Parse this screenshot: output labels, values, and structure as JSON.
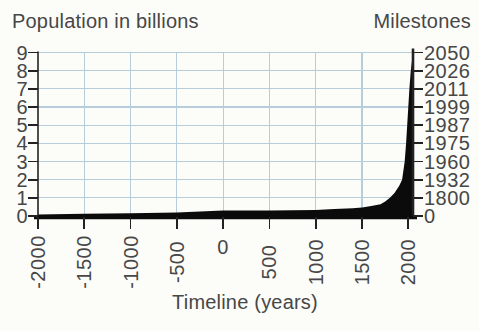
{
  "figure": {
    "left_axis_title": "Population in billions",
    "right_axis_title": "Milestones",
    "x_axis_title": "Timeline (years)"
  },
  "colors": {
    "background": "#fcfcf9",
    "grid": "#b7cddc",
    "area": "#0b0b0b",
    "axis": "#222222",
    "text": "#474747"
  },
  "chart_data": {
    "type": "area",
    "xlabel": "Timeline (years)",
    "ylabel_left": "Population in billions",
    "ylabel_right": "Milestones",
    "xlim": [
      -2000,
      2050
    ],
    "ylim": [
      0,
      9
    ],
    "grid": true,
    "x_ticks": [
      "-2000",
      "-1500",
      "-1000",
      "-500",
      "0",
      "500",
      "1000",
      "1500",
      "2000"
    ],
    "y_ticks": [
      0,
      1,
      2,
      3,
      4,
      5,
      6,
      7,
      8,
      9
    ],
    "series": [
      {
        "name": "World population (billions)",
        "points": [
          [
            -2000,
            0.09
          ],
          [
            -1500,
            0.12
          ],
          [
            -1000,
            0.15
          ],
          [
            -500,
            0.2
          ],
          [
            0,
            0.3
          ],
          [
            500,
            0.3
          ],
          [
            1000,
            0.33
          ],
          [
            1200,
            0.38
          ],
          [
            1400,
            0.43
          ],
          [
            1500,
            0.46
          ],
          [
            1600,
            0.55
          ],
          [
            1700,
            0.65
          ],
          [
            1750,
            0.8
          ],
          [
            1800,
            1
          ],
          [
            1850,
            1.26
          ],
          [
            1900,
            1.65
          ],
          [
            1932,
            2
          ],
          [
            1960,
            3
          ],
          [
            1975,
            4
          ],
          [
            1987,
            5
          ],
          [
            1999,
            6
          ],
          [
            2011,
            7
          ],
          [
            2026,
            8
          ],
          [
            2050,
            9
          ]
        ]
      }
    ],
    "milestones": [
      {
        "population_billions": 9,
        "year": "2050"
      },
      {
        "population_billions": 8,
        "year": "2026"
      },
      {
        "population_billions": 7,
        "year": "2011"
      },
      {
        "population_billions": 6,
        "year": "1999"
      },
      {
        "population_billions": 5,
        "year": "1987"
      },
      {
        "population_billions": 4,
        "year": "1975"
      },
      {
        "population_billions": 3,
        "year": "1960"
      },
      {
        "population_billions": 2,
        "year": "1932"
      },
      {
        "population_billions": 1,
        "year": "1800"
      },
      {
        "population_billions": 0,
        "year": "0"
      }
    ]
  }
}
